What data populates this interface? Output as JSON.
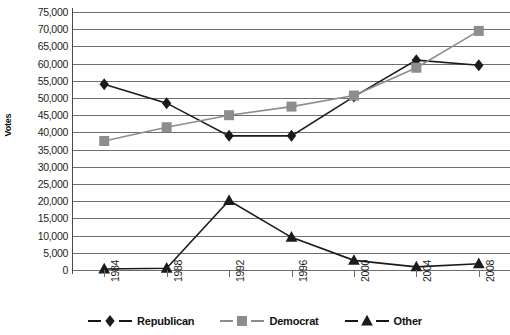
{
  "chart_data": {
    "type": "line",
    "title": "",
    "xlabel": "",
    "ylabel": "Votes",
    "categories": [
      "1984",
      "1988",
      "1992",
      "1996",
      "2000",
      "2004",
      "2008"
    ],
    "ylim": [
      0,
      75000
    ],
    "ytick_step": 5000,
    "grid": true,
    "legend_position": "bottom",
    "series": [
      {
        "name": "Republican",
        "marker": "diamond",
        "color": "#1b1b1b",
        "values": [
          54000,
          48500,
          39000,
          39000,
          50400,
          61000,
          59500
        ]
      },
      {
        "name": "Democrat",
        "marker": "square",
        "color": "#8d8d8d",
        "values": [
          37500,
          41500,
          45000,
          47500,
          50700,
          58800,
          69500
        ]
      },
      {
        "name": "Other",
        "marker": "triangle",
        "color": "#1b1b1b",
        "values": [
          300,
          500,
          20200,
          9500,
          2800,
          900,
          1800
        ]
      }
    ],
    "ytick_labels": [
      "75,000",
      "70,000",
      "65,000",
      "60,000",
      "55,000",
      "50,000",
      "45,000",
      "40,000",
      "35,000",
      "30,000",
      "25,000",
      "20,000",
      "15,000",
      "10,000",
      "5,000",
      "0"
    ]
  },
  "axis": {
    "y_title": "Votes"
  },
  "legend": {
    "items": [
      {
        "label": "Republican"
      },
      {
        "label": "Democrat"
      },
      {
        "label": "Other"
      }
    ]
  }
}
